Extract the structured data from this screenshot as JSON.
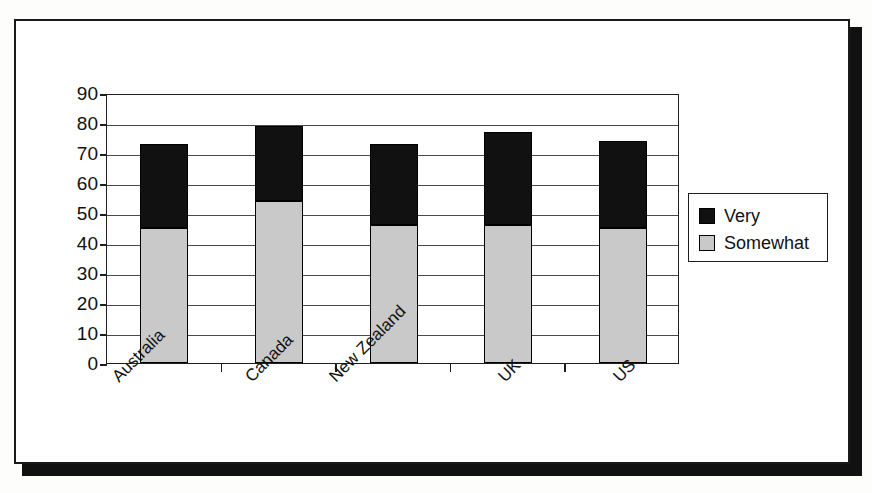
{
  "chart_data": {
    "type": "bar",
    "stacked": true,
    "title": "",
    "xlabel": "",
    "ylabel": "",
    "categories": [
      "Australia",
      "Canada",
      "New Zealand",
      "UK",
      "US"
    ],
    "series": [
      {
        "name": "Somewhat",
        "color": "#c9c9c9",
        "values": [
          45,
          54,
          46,
          46,
          45
        ]
      },
      {
        "name": "Very",
        "color": "#111111",
        "values": [
          28,
          25,
          27,
          31,
          29
        ]
      }
    ],
    "totals": [
      73,
      79,
      73,
      77,
      74
    ],
    "ylim": [
      0,
      90
    ],
    "ytick_step": 10,
    "yticks": [
      90,
      80,
      70,
      60,
      50,
      40,
      30,
      20,
      10,
      0
    ],
    "grid": true,
    "legend_position": "right",
    "legend_entries": [
      "Very",
      "Somewhat"
    ],
    "xtick_label_rotation": -45
  },
  "legend": {
    "entries": [
      {
        "label": "Very",
        "color": "#111111"
      },
      {
        "label": "Somewhat",
        "color": "#c9c9c9"
      }
    ]
  },
  "colors": {
    "very": "#111111",
    "somewhat": "#c9c9c9",
    "axis": "#1f1f1f",
    "grid": "#4a4a4a",
    "frame": "#1a1a1a",
    "shadow": "#111111"
  }
}
